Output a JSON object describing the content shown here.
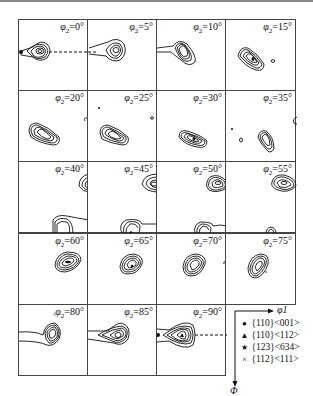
{
  "chart_data": {
    "type": "heatmap",
    "xlabel": "φ1",
    "ylabel": "Φ",
    "layout": {
      "rows": 5,
      "cols": 4,
      "sections": 19,
      "legend_position": "bottom-right"
    },
    "sections": [
      {
        "phi2": 0,
        "label": "φ2=0°"
      },
      {
        "phi2": 5,
        "label": "φ2=5°"
      },
      {
        "phi2": 10,
        "label": "φ2=10°"
      },
      {
        "phi2": 15,
        "label": "φ2=15°"
      },
      {
        "phi2": 20,
        "label": "φ2=20°"
      },
      {
        "phi2": 25,
        "label": "φ2=25°"
      },
      {
        "phi2": 30,
        "label": "φ2=30°"
      },
      {
        "phi2": 35,
        "label": "φ2=35°"
      },
      {
        "phi2": 40,
        "label": "φ2=40°"
      },
      {
        "phi2": 45,
        "label": "φ2=45°"
      },
      {
        "phi2": 50,
        "label": "φ2=50°"
      },
      {
        "phi2": 55,
        "label": "φ2=55°"
      },
      {
        "phi2": 60,
        "label": "φ2=60°"
      },
      {
        "phi2": 65,
        "label": "φ2=65°"
      },
      {
        "phi2": 70,
        "label": "φ2=70°"
      },
      {
        "phi2": 75,
        "label": "φ2=75°"
      },
      {
        "phi2": 80,
        "label": "φ2=80°"
      },
      {
        "phi2": 85,
        "label": "φ2=85°"
      },
      {
        "phi2": 90,
        "label": "φ2=90°"
      }
    ],
    "legend": [
      {
        "symbol": "●",
        "name": "circle",
        "label": "{110}<001>"
      },
      {
        "symbol": "▲",
        "name": "triangle",
        "label": "{110}<112>"
      },
      {
        "symbol": "★",
        "name": "star",
        "label": "{123}<634>"
      },
      {
        "symbol": "×",
        "name": "cross",
        "label": "{112}<111>"
      }
    ],
    "annotations": [
      "dashed line between φ2=0° and φ2=5° sections marking Goss {110}<001>",
      "dashed line in φ2=90° section marking Goss {110}<001>"
    ]
  },
  "labels": {
    "s0": "φ2=0°",
    "s1": "φ2=5°",
    "s2": "φ2=10°",
    "s3": "φ2=15°",
    "s4": "φ2=20°",
    "s5": "φ2=25°",
    "s6": "φ2=30°",
    "s7": "φ2=35°",
    "s8": "φ2=40°",
    "s9": "φ2=45°",
    "s10": "φ2=50°",
    "s11": "φ2=55°",
    "s12": "φ2=60°",
    "s13": "φ2=65°",
    "s14": "φ2=70°",
    "s15": "φ2=75°",
    "s16": "φ2=80°",
    "s17": "φ2=85°",
    "s18": "φ2=90°"
  },
  "legend": {
    "x_axis": "φ1",
    "y_axis": "Φ",
    "items": [
      {
        "symbol": "●",
        "label": "{110}<001>"
      },
      {
        "symbol": "▲",
        "label": "{110}<112>"
      },
      {
        "symbol": "★",
        "label": "{123}<634>"
      },
      {
        "symbol": "×",
        "label": "{112}<111>"
      }
    ]
  }
}
